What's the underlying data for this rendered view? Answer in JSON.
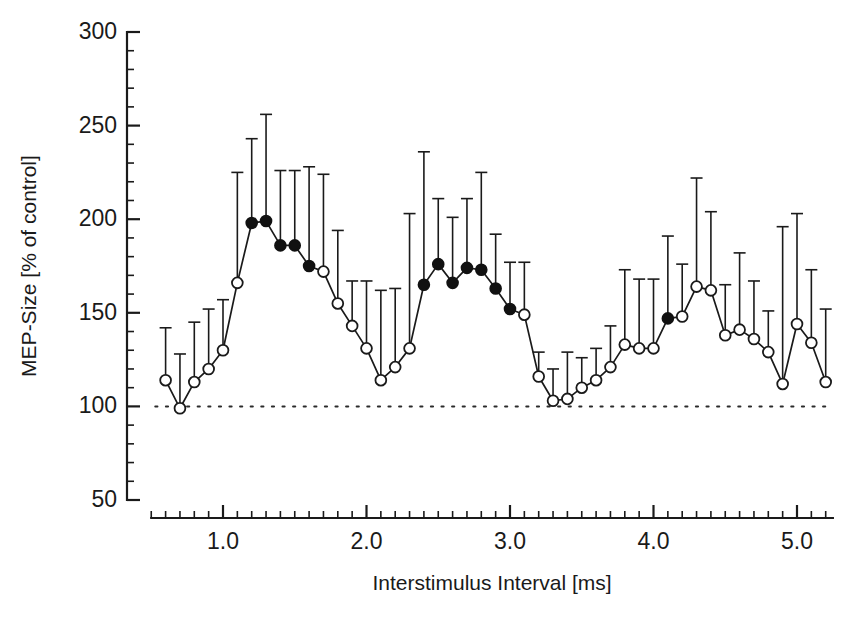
{
  "figure": {
    "background": "#ffffff",
    "foreground": "#1a1a1a"
  },
  "axes": {
    "y_title": "MEP-Size [% of control]",
    "x_title": "Interstimulus Interval [ms]",
    "y_ticklabels": [
      "300",
      "250",
      "200",
      "150",
      "100",
      "50"
    ],
    "x_ticklabels": [
      "1.0",
      "2.0",
      "3.0",
      "4.0",
      "5.0"
    ]
  },
  "chart_data": {
    "type": "line",
    "title": "",
    "xlabel": "Interstimulus Interval [ms]",
    "ylabel": "MEP-Size [% of control]",
    "xlim": [
      0.5,
      5.25
    ],
    "ylim": [
      50,
      300
    ],
    "x_major_ticks": [
      1.0,
      2.0,
      3.0,
      4.0,
      5.0
    ],
    "x_minor_tick_step": 0.1,
    "y_major_ticks": [
      50,
      100,
      150,
      200,
      250,
      300
    ],
    "y_minor_tick_step": 10,
    "grid": false,
    "legend": null,
    "reference_line": {
      "y": 100,
      "style": "dotted",
      "label": "control level (100%)"
    },
    "marker_legend": {
      "filled": "significant (p<0.05) facilitation",
      "open": "non-significant"
    },
    "series": [
      {
        "name": "MEP size (% of control) with SEM error bars",
        "x": [
          0.6,
          0.7,
          0.8,
          0.9,
          1.0,
          1.1,
          1.2,
          1.3,
          1.4,
          1.5,
          1.6,
          1.7,
          1.8,
          1.9,
          2.0,
          2.1,
          2.2,
          2.3,
          2.4,
          2.5,
          2.6,
          2.7,
          2.8,
          2.9,
          3.0,
          3.1,
          3.2,
          3.3,
          3.4,
          3.5,
          3.6,
          3.7,
          3.8,
          3.9,
          4.0,
          4.1,
          4.2,
          4.3,
          4.4,
          4.5,
          4.6,
          4.7,
          4.8,
          4.9,
          5.0,
          5.1,
          5.2
        ],
        "values": [
          114,
          99,
          113,
          120,
          130,
          166,
          198,
          199,
          186,
          186,
          175,
          172,
          155,
          143,
          131,
          114,
          121,
          131,
          165,
          176,
          166,
          174,
          173,
          163,
          152,
          149,
          116,
          103,
          104,
          110,
          114,
          121,
          133,
          131,
          131,
          147,
          148,
          164,
          162,
          138,
          141,
          136,
          129,
          112,
          144,
          134,
          113
        ],
        "errors_upper": [
          142,
          128,
          145,
          152,
          157,
          225,
          243,
          256,
          226,
          226,
          228,
          224,
          194,
          167,
          167,
          162,
          163,
          203,
          236,
          211,
          201,
          211,
          225,
          192,
          177,
          177,
          129,
          120,
          129,
          126,
          131,
          143,
          173,
          168,
          168,
          191,
          176,
          222,
          204,
          165,
          182,
          167,
          151,
          196,
          203,
          173,
          152
        ],
        "filled": [
          false,
          false,
          false,
          false,
          false,
          false,
          true,
          true,
          true,
          true,
          true,
          false,
          false,
          false,
          false,
          false,
          false,
          false,
          true,
          true,
          true,
          true,
          true,
          true,
          true,
          false,
          false,
          false,
          false,
          false,
          false,
          false,
          false,
          false,
          false,
          true,
          false,
          false,
          false,
          false,
          false,
          false,
          false,
          false,
          false,
          false,
          false
        ]
      }
    ]
  }
}
